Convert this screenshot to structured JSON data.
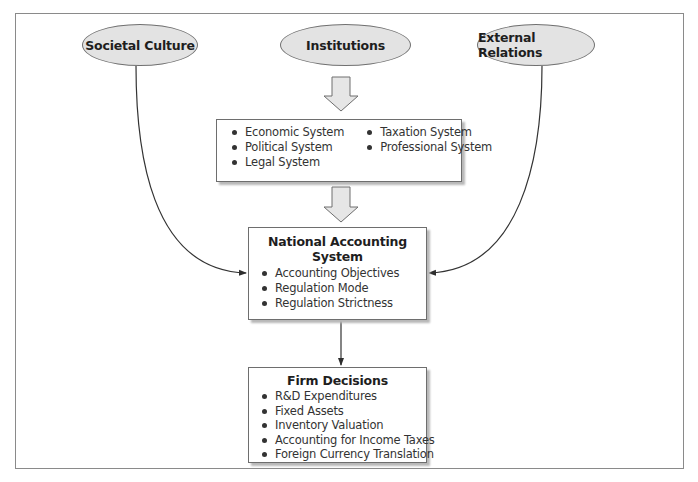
{
  "diagram": {
    "influences": [
      {
        "id": "societal-culture",
        "label": "Societal Culture"
      },
      {
        "id": "institutions",
        "label": "Institutions"
      },
      {
        "id": "external-relations",
        "label": "External Relations"
      }
    ],
    "institutions_box": {
      "column_left": [
        "Economic System",
        "Political System",
        "Legal System"
      ],
      "column_right": [
        "Taxation System",
        "Professional System"
      ]
    },
    "national_accounting_system": {
      "title": "National Accounting System",
      "items": [
        "Accounting Objectives",
        "Regulation Mode",
        "Regulation Strictness"
      ]
    },
    "firm_decisions": {
      "title": "Firm Decisions",
      "items": [
        "R&D Expenditures",
        "Fixed Assets",
        "Inventory Valuation",
        "Accounting for Income Taxes",
        "Foreign Currency Translation"
      ]
    },
    "edges": [
      {
        "from": "Institutions",
        "to": "Institutions Box",
        "style": "block-arrow"
      },
      {
        "from": "Institutions Box",
        "to": "National Accounting System",
        "style": "block-arrow"
      },
      {
        "from": "Societal Culture",
        "to": "National Accounting System",
        "style": "curved-arrow"
      },
      {
        "from": "External Relations",
        "to": "National Accounting System",
        "style": "curved-arrow"
      },
      {
        "from": "National Accounting System",
        "to": "Firm Decisions",
        "style": "straight-arrow"
      }
    ],
    "colors": {
      "ellipse_fill": "#e3e3e3",
      "block_arrow_fill": "#e6e6e6",
      "stroke": "#6e6e6e",
      "connector": "#333333"
    }
  }
}
